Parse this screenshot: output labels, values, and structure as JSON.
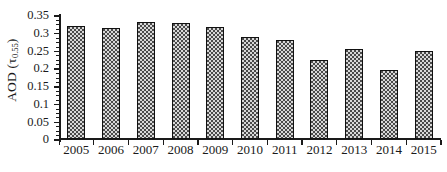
{
  "chart_data": {
    "type": "bar",
    "title": "",
    "xlabel": "",
    "ylabel": "AOD (τ0.55)",
    "ylabel_main": "AOD (",
    "ylabel_symbol": "τ",
    "ylabel_subscript": "0.55",
    "ylabel_close": ")",
    "categories": [
      "2005",
      "2006",
      "2007",
      "2008",
      "2009",
      "2010",
      "2011",
      "2012",
      "2013",
      "2014",
      "2015"
    ],
    "values": [
      0.32,
      0.312,
      0.331,
      0.327,
      0.317,
      0.289,
      0.28,
      0.222,
      0.255,
      0.196,
      0.248
    ],
    "ylim": [
      0,
      0.35
    ],
    "ytick_labels": [
      "0",
      "0.05",
      "0.1",
      "0.15",
      "0.2",
      "0.25",
      "0.3",
      "0.35"
    ],
    "ytick_values": [
      0,
      0.05,
      0.1,
      0.15,
      0.2,
      0.25,
      0.3,
      0.35
    ],
    "yminor_step": 0.0125,
    "grid": false,
    "legend": null,
    "legend_position": "none",
    "bar_fill_color": "#4a4a4a",
    "bar_pattern": "checkerboard",
    "bar_border_color": "#111111",
    "axis_color": "#1a1a1a",
    "background_color": "#ffffff"
  }
}
